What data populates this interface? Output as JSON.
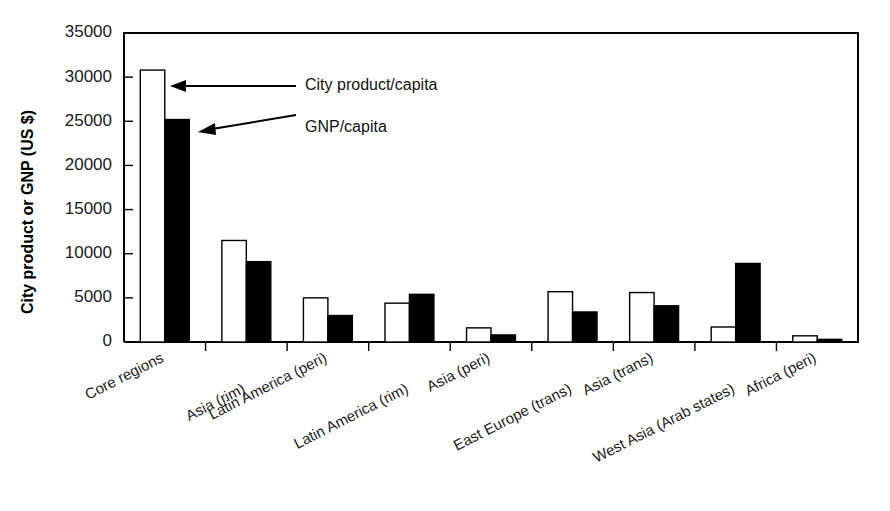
{
  "chart_data": {
    "type": "bar",
    "title": "",
    "xlabel": "",
    "ylabel": "City product or GNP (US $)",
    "ylim": [
      0,
      35000
    ],
    "grid": false,
    "legend_position": "inline-annotations",
    "yticks": [
      0,
      5000,
      10000,
      15000,
      20000,
      25000,
      30000,
      35000
    ],
    "ytick_labels": [
      "0",
      "5000",
      "10000",
      "15000",
      "20000",
      "25000",
      "30000",
      "35000"
    ],
    "categories": [
      "Core regions",
      "Asia (rim)",
      "Latin America (peri)",
      "Latin America (rim)",
      "Asia (peri)",
      "East Europe (trans)",
      "Asia (trans)",
      "West Asia (Arab states)",
      "Africa (peri)"
    ],
    "series": [
      {
        "name": "City product/capita",
        "color": "#ffffff",
        "edge_color": "#000000",
        "values": [
          30800,
          11500,
          5000,
          4400,
          1600,
          5700,
          5600,
          1700,
          700
        ]
      },
      {
        "name": "GNP/capita",
        "color": "#000000",
        "edge_color": "#000000",
        "values": [
          25200,
          9100,
          3000,
          5400,
          800,
          3400,
          4100,
          8900,
          300
        ]
      }
    ],
    "annotations": [
      {
        "text": "City product/capita",
        "points_to_series": "City product/capita",
        "points_to_category": "Core regions"
      },
      {
        "text": "GNP/capita",
        "points_to_series": "GNP/capita",
        "points_to_category": "Core regions"
      }
    ]
  }
}
